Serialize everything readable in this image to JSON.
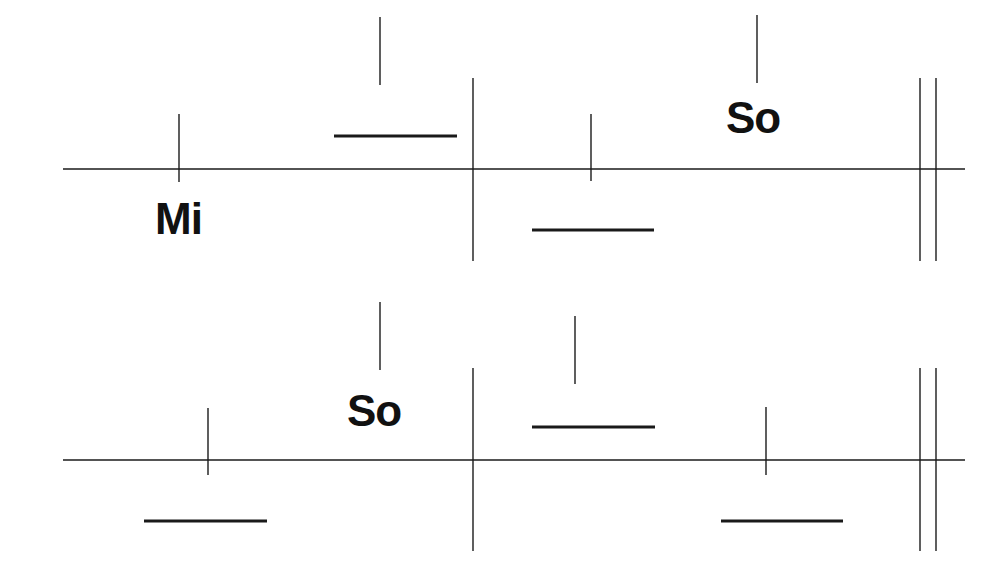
{
  "diagram": {
    "type": "rhythm-staff-notation",
    "colors": {
      "ink": "#1a1a1a",
      "background": "#ffffff"
    },
    "rows": [
      {
        "staff_line": {
          "y": 169,
          "x1": 63,
          "x2": 965
        },
        "barlines": [
          {
            "x": 473,
            "y1": 78,
            "y2": 261
          }
        ],
        "final_barline": {
          "x1": 920,
          "x2": 936,
          "y1": 78,
          "y2": 261
        },
        "ticks": [
          {
            "x": 179,
            "y1": 114,
            "y2": 182
          },
          {
            "x": 591,
            "y1": 114,
            "y2": 181
          }
        ],
        "stems": [
          {
            "x": 380,
            "y1": 17,
            "y2": 85
          },
          {
            "x": 757,
            "y1": 15,
            "y2": 83
          }
        ],
        "dashes": [
          {
            "y": 136,
            "x1": 334,
            "x2": 457
          },
          {
            "y": 230,
            "x1": 532,
            "x2": 654
          }
        ],
        "labels": [
          {
            "text": "Mi",
            "x": 155,
            "y": 197
          },
          {
            "text": "So",
            "x": 726,
            "y": 96
          }
        ]
      },
      {
        "staff_line": {
          "y": 460,
          "x1": 63,
          "x2": 965
        },
        "barlines": [
          {
            "x": 473,
            "y1": 368,
            "y2": 551
          }
        ],
        "final_barline": {
          "x1": 920,
          "x2": 936,
          "y1": 368,
          "y2": 551
        },
        "ticks": [
          {
            "x": 208,
            "y1": 408,
            "y2": 475
          },
          {
            "x": 766,
            "y1": 407,
            "y2": 475
          }
        ],
        "stems": [
          {
            "x": 380,
            "y1": 302,
            "y2": 370
          },
          {
            "x": 575,
            "y1": 316,
            "y2": 384
          }
        ],
        "dashes": [
          {
            "y": 521,
            "x1": 144,
            "x2": 267
          },
          {
            "y": 427,
            "x1": 532,
            "x2": 655
          },
          {
            "y": 521,
            "x1": 721,
            "x2": 843
          }
        ],
        "labels": [
          {
            "text": "So",
            "x": 347,
            "y": 389
          }
        ]
      }
    ]
  }
}
